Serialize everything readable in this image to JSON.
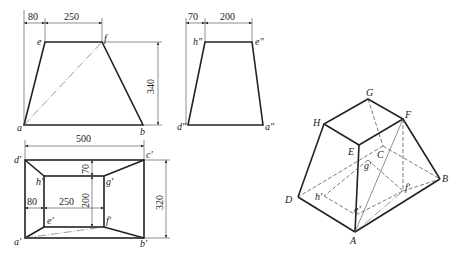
{
  "front_view": {
    "labels": {
      "a": "a",
      "b": "b",
      "e": "e",
      "f": "f"
    },
    "dims": {
      "left_offset": "80",
      "top_width": "250",
      "height": "340",
      "bottom_width": "500"
    }
  },
  "side_view": {
    "labels": {
      "d": "d\"",
      "a": "a\"",
      "h": "h\"",
      "e": "e\""
    },
    "dims": {
      "left_offset": "70",
      "top_width": "200"
    }
  },
  "top_view": {
    "labels": {
      "d": "d'",
      "c": "c'",
      "b": "b'",
      "a": "a'",
      "h": "h'",
      "g": "g'",
      "f": "f'",
      "e": "e'"
    },
    "dims": {
      "width": "500",
      "depth": "320",
      "inner_offset": "70",
      "inner_depth": "200",
      "left_offset": "80",
      "inner_width": "250"
    }
  },
  "iso_view": {
    "labels": {
      "G": "G",
      "H": "H",
      "F": "F",
      "E": "E",
      "C": "C",
      "g": "g'",
      "h": "h'",
      "f": "f'",
      "e": "e'",
      "D": "D",
      "B": "B",
      "A": "A"
    }
  }
}
